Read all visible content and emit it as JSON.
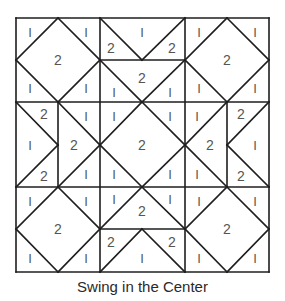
{
  "diagram": {
    "title": "Swing in the Center",
    "colors": {
      "line": "#1e1e1e",
      "label": "#555555",
      "background": "#ffffff"
    },
    "grid": {
      "x": [
        16,
        58,
        100,
        142,
        185,
        227,
        269
      ],
      "y": [
        18,
        60,
        102,
        145,
        187,
        229,
        272
      ]
    },
    "blocks": [
      {
        "name": "block-top-left",
        "type": "square-in-square",
        "labels": [
          {
            "t": "1",
            "x": 30,
            "y": 32
          },
          {
            "t": "1",
            "x": 86,
            "y": 32
          },
          {
            "t": "2",
            "x": 58,
            "y": 60
          },
          {
            "t": "1",
            "x": 30,
            "y": 88
          },
          {
            "t": "1",
            "x": 86,
            "y": 88
          }
        ]
      },
      {
        "name": "block-top-center",
        "type": "flying-geese-pair",
        "labels": [
          {
            "t": "2",
            "x": 111,
            "y": 48
          },
          {
            "t": "1",
            "x": 142,
            "y": 32
          },
          {
            "t": "2",
            "x": 172,
            "y": 48
          },
          {
            "t": "2",
            "x": 142,
            "y": 78
          },
          {
            "t": "1",
            "x": 114,
            "y": 92
          },
          {
            "t": "1",
            "x": 170,
            "y": 92
          }
        ]
      },
      {
        "name": "block-top-right",
        "type": "square-in-square",
        "labels": [
          {
            "t": "1",
            "x": 199,
            "y": 32
          },
          {
            "t": "1",
            "x": 255,
            "y": 32
          },
          {
            "t": "2",
            "x": 227,
            "y": 60
          },
          {
            "t": "1",
            "x": 199,
            "y": 88
          },
          {
            "t": "1",
            "x": 255,
            "y": 88
          }
        ]
      },
      {
        "name": "block-middle-left",
        "type": "flying-geese-pair",
        "labels": [
          {
            "t": "2",
            "x": 44,
            "y": 114
          },
          {
            "t": "1",
            "x": 30,
            "y": 145
          },
          {
            "t": "2",
            "x": 44,
            "y": 176
          },
          {
            "t": "1",
            "x": 86,
            "y": 116
          },
          {
            "t": "2",
            "x": 74,
            "y": 145
          },
          {
            "t": "1",
            "x": 86,
            "y": 174
          }
        ]
      },
      {
        "name": "block-center",
        "type": "square-in-square",
        "labels": [
          {
            "t": "1",
            "x": 114,
            "y": 116
          },
          {
            "t": "1",
            "x": 170,
            "y": 116
          },
          {
            "t": "2",
            "x": 142,
            "y": 145
          },
          {
            "t": "1",
            "x": 114,
            "y": 174
          },
          {
            "t": "1",
            "x": 170,
            "y": 174
          }
        ]
      },
      {
        "name": "block-middle-right",
        "type": "flying-geese-pair",
        "labels": [
          {
            "t": "1",
            "x": 197,
            "y": 116
          },
          {
            "t": "2",
            "x": 210,
            "y": 145
          },
          {
            "t": "1",
            "x": 197,
            "y": 174
          },
          {
            "t": "2",
            "x": 241,
            "y": 114
          },
          {
            "t": "1",
            "x": 255,
            "y": 145
          },
          {
            "t": "2",
            "x": 241,
            "y": 176
          }
        ]
      },
      {
        "name": "block-bottom-left",
        "type": "square-in-square",
        "labels": [
          {
            "t": "1",
            "x": 30,
            "y": 201
          },
          {
            "t": "1",
            "x": 86,
            "y": 201
          },
          {
            "t": "2",
            "x": 58,
            "y": 229
          },
          {
            "t": "1",
            "x": 30,
            "y": 258
          },
          {
            "t": "1",
            "x": 86,
            "y": 258
          }
        ]
      },
      {
        "name": "block-bottom-center",
        "type": "flying-geese-pair",
        "labels": [
          {
            "t": "1",
            "x": 114,
            "y": 199
          },
          {
            "t": "2",
            "x": 142,
            "y": 211
          },
          {
            "t": "1",
            "x": 170,
            "y": 199
          },
          {
            "t": "2",
            "x": 111,
            "y": 242
          },
          {
            "t": "1",
            "x": 142,
            "y": 258
          },
          {
            "t": "2",
            "x": 172,
            "y": 242
          }
        ]
      },
      {
        "name": "block-bottom-right",
        "type": "square-in-square",
        "labels": [
          {
            "t": "1",
            "x": 199,
            "y": 201
          },
          {
            "t": "1",
            "x": 255,
            "y": 201
          },
          {
            "t": "2",
            "x": 227,
            "y": 229
          },
          {
            "t": "1",
            "x": 199,
            "y": 258
          },
          {
            "t": "1",
            "x": 255,
            "y": 258
          }
        ]
      }
    ],
    "lines": [
      [
        16,
        18,
        269,
        18
      ],
      [
        16,
        272,
        269,
        272
      ],
      [
        16,
        18,
        16,
        272
      ],
      [
        269,
        18,
        269,
        272
      ],
      [
        100,
        18,
        100,
        272
      ],
      [
        185,
        18,
        185,
        272
      ],
      [
        16,
        102,
        269,
        102
      ],
      [
        16,
        187,
        269,
        187
      ],
      [
        100,
        60,
        185,
        60
      ],
      [
        100,
        229,
        185,
        229
      ],
      [
        58,
        102,
        58,
        187
      ],
      [
        227,
        102,
        227,
        187
      ],
      [
        58,
        18,
        100,
        60
      ],
      [
        100,
        60,
        58,
        102
      ],
      [
        58,
        102,
        16,
        60
      ],
      [
        16,
        60,
        58,
        18
      ],
      [
        227,
        18,
        269,
        60
      ],
      [
        269,
        60,
        227,
        102
      ],
      [
        227,
        102,
        185,
        60
      ],
      [
        185,
        60,
        227,
        18
      ],
      [
        58,
        187,
        100,
        229
      ],
      [
        100,
        229,
        58,
        272
      ],
      [
        58,
        272,
        16,
        229
      ],
      [
        16,
        229,
        58,
        187
      ],
      [
        227,
        187,
        269,
        229
      ],
      [
        269,
        229,
        227,
        272
      ],
      [
        227,
        272,
        185,
        229
      ],
      [
        185,
        229,
        227,
        187
      ],
      [
        142,
        102,
        185,
        145
      ],
      [
        185,
        145,
        142,
        187
      ],
      [
        142,
        187,
        100,
        145
      ],
      [
        100,
        145,
        142,
        102
      ],
      [
        100,
        18,
        142,
        60
      ],
      [
        185,
        18,
        142,
        60
      ],
      [
        100,
        60,
        142,
        102
      ],
      [
        185,
        60,
        142,
        102
      ],
      [
        142,
        187,
        100,
        229
      ],
      [
        142,
        187,
        185,
        229
      ],
      [
        142,
        229,
        100,
        272
      ],
      [
        142,
        229,
        185,
        272
      ],
      [
        16,
        102,
        58,
        145
      ],
      [
        16,
        187,
        58,
        145
      ],
      [
        58,
        102,
        100,
        145
      ],
      [
        58,
        187,
        100,
        145
      ],
      [
        227,
        102,
        185,
        145
      ],
      [
        227,
        187,
        185,
        145
      ],
      [
        269,
        102,
        227,
        145
      ],
      [
        269,
        187,
        227,
        145
      ]
    ]
  }
}
